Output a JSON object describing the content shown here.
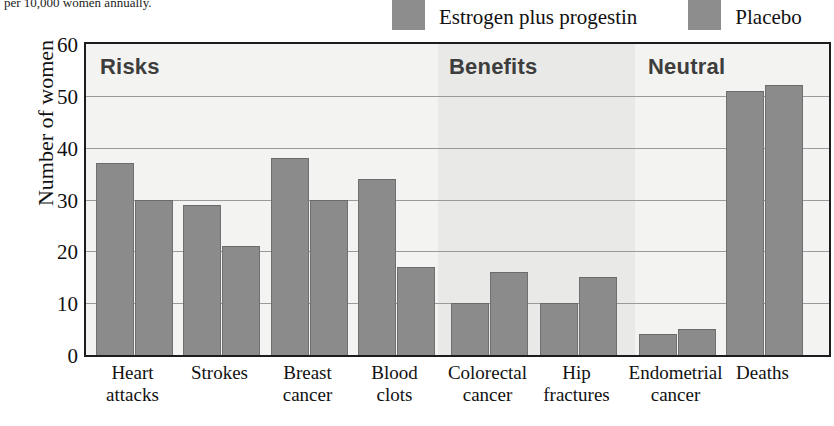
{
  "caption": "per 10,000 women annually.",
  "legend": {
    "items": [
      {
        "label": "Estrogen plus progestin",
        "color": "#8d8d8d",
        "swatch_icon": "legend-swatch-icon"
      },
      {
        "label": "Placebo",
        "color": "#8d8d8d",
        "swatch_icon": "legend-swatch-icon"
      }
    ]
  },
  "axes": {
    "y_title": "Number of women",
    "y_ticks": [
      "60",
      "50",
      "40",
      "30",
      "20",
      "10",
      "0"
    ]
  },
  "sections": [
    {
      "label": "Risks"
    },
    {
      "label": "Benefits"
    },
    {
      "label": "Neutral"
    }
  ],
  "chart_data": {
    "type": "bar",
    "title": "",
    "subtitle": "",
    "xlabel": "",
    "ylabel": "Number of women",
    "ylim": [
      0,
      60
    ],
    "ytick_values": [
      0,
      10,
      20,
      30,
      40,
      50,
      60
    ],
    "grid": true,
    "legend_position": "top-right",
    "categories": [
      "Heart attacks",
      "Strokes",
      "Breast cancer",
      "Blood clots",
      "Colorectal cancer",
      "Hip fractures",
      "Endometrial cancer",
      "Deaths"
    ],
    "category_lines": [
      [
        "Heart",
        "attacks"
      ],
      [
        "Strokes",
        ""
      ],
      [
        "Breast",
        "cancer"
      ],
      [
        "Blood",
        "clots"
      ],
      [
        "Colorectal",
        "cancer"
      ],
      [
        "Hip",
        "fractures"
      ],
      [
        "Endometrial",
        "cancer"
      ],
      [
        "Deaths",
        ""
      ]
    ],
    "groups": [
      {
        "label": "Risks",
        "categories": [
          "Heart attacks",
          "Strokes",
          "Breast cancer",
          "Blood clots"
        ]
      },
      {
        "label": "Benefits",
        "categories": [
          "Colorectal cancer",
          "Hip fractures"
        ]
      },
      {
        "label": "Neutral",
        "categories": [
          "Endometrial cancer",
          "Deaths"
        ]
      }
    ],
    "series": [
      {
        "name": "Estrogen plus progestin",
        "color": "#8b8b8b",
        "values": [
          37,
          29,
          38,
          34,
          10,
          10,
          4,
          51
        ]
      },
      {
        "name": "Placebo",
        "color": "#8b8b8b",
        "values": [
          30,
          21,
          30,
          17,
          16,
          15,
          5,
          52
        ]
      }
    ]
  }
}
